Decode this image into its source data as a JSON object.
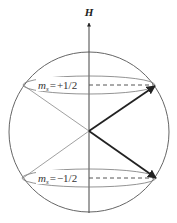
{
  "diagram": {
    "axis_label": "H",
    "states": [
      {
        "symbol": "m",
        "subscript": "s",
        "equals": "=",
        "value": "+1/2"
      },
      {
        "symbol": "m",
        "subscript": "s",
        "equals": "=",
        "value": "−1/2"
      }
    ],
    "colors": {
      "line": "#555555",
      "arrow": "#222222",
      "background": "#ffffff"
    }
  }
}
